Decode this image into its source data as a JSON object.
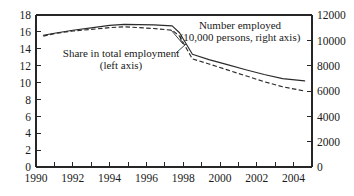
{
  "chart_data": {
    "type": "line",
    "title": "",
    "subtitle": "",
    "xlabel": "",
    "ylabel": "",
    "y2label": "",
    "xlim": [
      1990,
      2005
    ],
    "ylim": [
      0,
      18
    ],
    "y2lim": [
      0,
      12000
    ],
    "grid": false,
    "legend_position": "inline-annotations",
    "x_ticks": [
      1990,
      1991,
      1992,
      1993,
      1994,
      1995,
      1996,
      1997,
      1998,
      1999,
      2000,
      2001,
      2002,
      2003,
      2004,
      2005
    ],
    "x_tick_labels": [
      "1990",
      "",
      "1992",
      "",
      "1994",
      "",
      "1996",
      "",
      "1998",
      "",
      "2000",
      "",
      "2002",
      "",
      "2004",
      ""
    ],
    "y_ticks": [
      0,
      2,
      4,
      6,
      8,
      10,
      12,
      14,
      16,
      18
    ],
    "y_tick_labels": [
      "0",
      "2",
      "4",
      "6",
      "8",
      "10",
      "12",
      "14",
      "16",
      "18"
    ],
    "y2_ticks": [
      0,
      2000,
      4000,
      6000,
      8000,
      10000,
      12000
    ],
    "y2_tick_labels": [
      "0",
      "2000",
      "4000",
      "6000",
      "8000",
      "10000",
      "12000"
    ],
    "annotations": [
      {
        "name": "number-employed-annotation",
        "line1": "Number employed",
        "line2": "(10,000 persons, right axis)",
        "axis": "right",
        "style": "solid"
      },
      {
        "name": "share-employment-annotation",
        "line1": "Share in total employment",
        "line2": "(left axis)",
        "axis": "left",
        "style": "dashed"
      }
    ],
    "series": [
      {
        "name": "Number employed (10,000 persons, right axis)",
        "axis": "right",
        "style": "solid",
        "color": "#2b2b2b",
        "x": [
          1990.4,
          1991,
          1992,
          1993,
          1994,
          1994.8,
          1995.6,
          1996.4,
          1997.4,
          1997.8,
          1998.5,
          1999.4,
          2000.4,
          2001.4,
          2002.4,
          2003.4,
          2004.6
        ],
        "values": [
          10400,
          10560,
          10800,
          10980,
          11180,
          11260,
          11240,
          11220,
          11140,
          10600,
          8900,
          8480,
          8080,
          7680,
          7300,
          6980,
          6800
        ]
      },
      {
        "name": "Share in total employment (left axis)",
        "axis": "left",
        "style": "dashed",
        "color": "#2b2b2b",
        "x": [
          1990.4,
          1991,
          1992,
          1993,
          1994,
          1994.8,
          1995.6,
          1996.4,
          1997.4,
          1997.8,
          1998.5,
          1999.4,
          2000.4,
          2001.4,
          2002.4,
          2003.4,
          2004.6
        ],
        "values": [
          15.5,
          15.8,
          16.1,
          16.3,
          16.5,
          16.6,
          16.5,
          16.4,
          16.2,
          15.5,
          12.8,
          12.2,
          11.5,
          10.8,
          10.1,
          9.5,
          9.0
        ]
      }
    ],
    "series_left_axis_equivalent": {
      "note": "solid line read on left axis",
      "values": [
        15.6,
        15.9,
        16.2,
        16.5,
        16.8,
        16.9,
        16.9,
        16.85,
        16.75,
        15.9,
        13.35,
        12.7,
        12.1,
        11.5,
        10.95,
        10.45,
        10.2
      ]
    }
  }
}
